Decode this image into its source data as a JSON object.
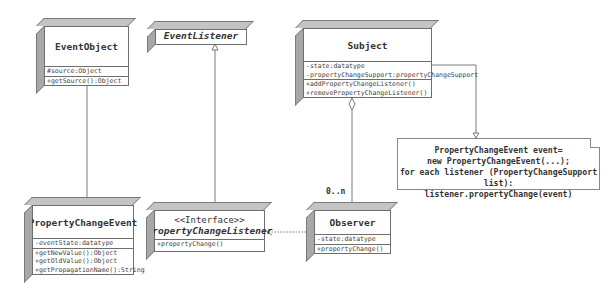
{
  "diagram": {
    "type": "uml-class-diagram",
    "classes": [
      {
        "id": "event_object",
        "name": "EventObject",
        "stereotype": null,
        "attributes": [
          "#source:Object"
        ],
        "methods": [
          "+getSource():Object"
        ]
      },
      {
        "id": "event_listener",
        "name": "EventListener",
        "stereotype": "<<Interface>>",
        "attributes": [],
        "methods": []
      },
      {
        "id": "subject",
        "name": "Subject",
        "stereotype": null,
        "attributes": [
          "-state:datatype",
          "-propertyChangeSupport:propertyChangeSupport"
        ],
        "methods": [
          "+addPropertyChangeListener()",
          "+removePropertyChangeListener()"
        ]
      },
      {
        "id": "property_change_event",
        "name": "PropertyChangeEvent",
        "stereotype": null,
        "attributes": [
          "-eventState:datatype"
        ],
        "methods": [
          "+getNewValue():Object",
          "+getOldValue():Object",
          "+getPropagationName():String"
        ]
      },
      {
        "id": "property_change_listener",
        "name": "PropertyChangeListener",
        "stereotype": "<<Interface>>",
        "attributes": [],
        "methods": [
          "+propertyChange()"
        ]
      },
      {
        "id": "observer",
        "name": "Observer",
        "stereotype": null,
        "attributes": [
          "-state:datatype"
        ],
        "methods": [
          "+propertyChange()"
        ]
      }
    ],
    "note": {
      "lines": [
        "PropertyChangeEvent event=",
        "new PropertyChangeEvent(...);",
        "for each listener (PropertyChangeSupport list):",
        "listener.propertyChange(event)"
      ]
    },
    "multiplicity": "0..n",
    "relations": [
      {
        "from": "property_change_event",
        "to": "event_object",
        "kind": "generalization"
      },
      {
        "from": "property_change_listener",
        "to": "event_listener",
        "kind": "generalization"
      },
      {
        "from": "observer",
        "to": "property_change_listener",
        "kind": "realization"
      },
      {
        "from": "subject",
        "to": "observer",
        "kind": "aggregation",
        "multiplicity": "0..n"
      },
      {
        "from": "subject",
        "to": "note",
        "kind": "note-link"
      }
    ],
    "colors": {
      "line": "#6e6e6e",
      "side_face": "#a8a8a8",
      "top_face": "#c4c4c4",
      "background": "#ffffff"
    }
  }
}
